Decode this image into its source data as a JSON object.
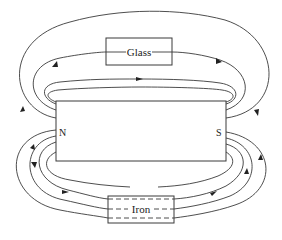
{
  "diagram": {
    "magnet": {
      "north_label": "N",
      "south_label": "S"
    },
    "materials": [
      {
        "name": "glass",
        "label": "Glass"
      },
      {
        "name": "iron",
        "label": "Iron"
      }
    ],
    "colors": {
      "stroke": "#3a3a3a",
      "background": "#ffffff"
    }
  }
}
